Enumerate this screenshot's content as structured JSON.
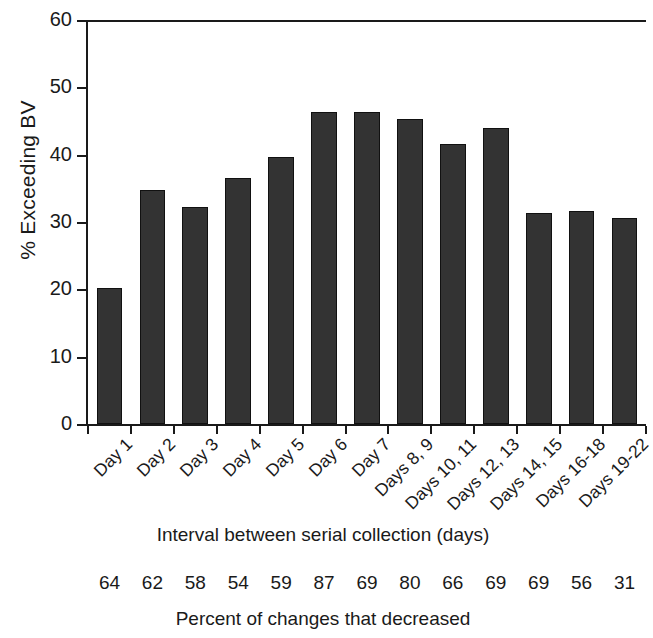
{
  "chart_data": {
    "type": "bar",
    "title": "",
    "xlabel": "Interval between serial collection (days)",
    "ylabel": "% Exceeding BV",
    "ylim": [
      0,
      60
    ],
    "yticks": [
      0,
      10,
      20,
      30,
      40,
      50,
      60
    ],
    "ytick_labels": [
      "0",
      "10",
      "20",
      "30",
      "40",
      "50",
      "60"
    ],
    "grid": false,
    "legend": null,
    "bar_color": "#333333",
    "bar_edge_color": "#111111",
    "categories": [
      "Day 1",
      "Day 2",
      "Day 3",
      "Day 4",
      "Day 5",
      "Day 6",
      "Day 7",
      "Days 8, 9",
      "Days 10, 11",
      "Days 12, 13",
      "Days 14, 15",
      "Days 16-18",
      "Days 19-22"
    ],
    "values": [
      20.2,
      34.7,
      32.3,
      36.6,
      39.7,
      46.3,
      46.4,
      45.3,
      41.6,
      44.0,
      31.4,
      31.6,
      30.6
    ],
    "secondary_row": {
      "caption": "Percent of changes that decreased",
      "values": [
        "64",
        "62",
        "58",
        "54",
        "59",
        "87",
        "69",
        "80",
        "66",
        "69",
        "69",
        "56",
        "31"
      ]
    }
  },
  "axis": {
    "y_title": "% Exceeding BV",
    "x_title": "Interval between serial collection (days)"
  },
  "footer": {
    "caption": "Percent of changes that decreased"
  }
}
